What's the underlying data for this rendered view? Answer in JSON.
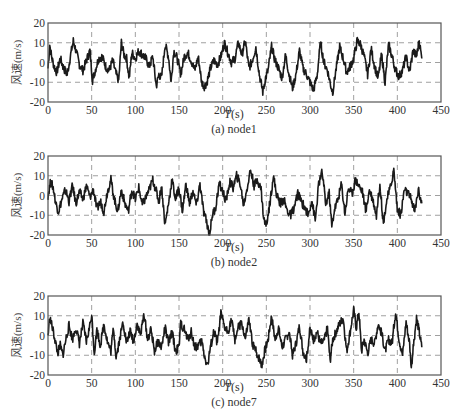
{
  "chart_data": [
    {
      "type": "line",
      "title": "(a) node1",
      "xlabel": "T(s)",
      "ylabel": "风速(m/s)",
      "xlim": [
        0,
        450
      ],
      "ylim": [
        -20,
        20
      ],
      "xticks": [
        0,
        50,
        100,
        150,
        200,
        250,
        300,
        350,
        400,
        450
      ],
      "yticks": [
        20,
        10,
        0,
        -10,
        -20
      ],
      "grid": true,
      "series": [
        {
          "name": "node1",
          "x": [
            0,
            2,
            4,
            7,
            10,
            14,
            18,
            22,
            26,
            29,
            32,
            36,
            40,
            44,
            48,
            51,
            54,
            58,
            62,
            66,
            70,
            74,
            78,
            81,
            84,
            87,
            90,
            93,
            96,
            100,
            104,
            108,
            112,
            116,
            120,
            124,
            127,
            130,
            134,
            138,
            141,
            144,
            148,
            152,
            156,
            160,
            164,
            168,
            172,
            176,
            179,
            182,
            186,
            190,
            194,
            198,
            202,
            206,
            210,
            214,
            218,
            222,
            226,
            230,
            234,
            238,
            242,
            246,
            249,
            252,
            256,
            260,
            264,
            268,
            272,
            276,
            280,
            284,
            288,
            292,
            296,
            300,
            304,
            308,
            312,
            316,
            320,
            324,
            326,
            330,
            334,
            338,
            342,
            346,
            350,
            354,
            358,
            362,
            366,
            370,
            374,
            378,
            382,
            386,
            390,
            394,
            398,
            402,
            406,
            410,
            414,
            418,
            422,
            425,
            428
          ],
          "y": [
            -3,
            9,
            3,
            -2,
            -5,
            2,
            -3,
            -6,
            4,
            11,
            6,
            -1,
            -4,
            1,
            6,
            -9,
            -4,
            2,
            3,
            -2,
            -4,
            1,
            -6,
            -9,
            10,
            4,
            2,
            -8,
            5,
            2,
            6,
            4,
            2,
            -2,
            3,
            -12,
            -6,
            -8,
            9,
            3,
            -10,
            6,
            2,
            -6,
            3,
            5,
            1,
            -4,
            3,
            -10,
            -12,
            -10,
            -3,
            1,
            -1,
            3,
            10,
            5,
            0,
            2,
            10,
            4,
            11,
            -3,
            1,
            8,
            -6,
            -15,
            -8,
            -4,
            8,
            1,
            -3,
            -8,
            4,
            -6,
            -13,
            -6,
            6,
            -3,
            -6,
            -10,
            -14,
            -7,
            10,
            0,
            -4,
            -12,
            -15,
            -3,
            8,
            2,
            -5,
            -2,
            2,
            11,
            9,
            3,
            -6,
            7,
            -2,
            -8,
            4,
            -10,
            9,
            3,
            -4,
            -7,
            -4,
            3,
            -5,
            6,
            3,
            11,
            2
          ]
        }
      ]
    },
    {
      "type": "line",
      "title": "(b) node2",
      "xlabel": "T(s)",
      "ylabel": "风速(m/s)",
      "xlim": [
        0,
        450
      ],
      "ylim": [
        -20,
        20
      ],
      "xticks": [
        0,
        50,
        100,
        150,
        200,
        250,
        300,
        350,
        400,
        450
      ],
      "yticks": [
        20,
        10,
        0,
        -10,
        -20
      ],
      "grid": true,
      "series": [
        {
          "name": "node2",
          "x": [
            0,
            3,
            6,
            9,
            12,
            16,
            20,
            24,
            28,
            32,
            36,
            40,
            44,
            48,
            52,
            56,
            60,
            64,
            68,
            72,
            76,
            80,
            84,
            88,
            92,
            96,
            100,
            104,
            108,
            112,
            116,
            120,
            124,
            127,
            130,
            134,
            138,
            142,
            146,
            150,
            154,
            158,
            162,
            166,
            170,
            174,
            178,
            182,
            185,
            188,
            192,
            196,
            200,
            204,
            208,
            212,
            216,
            220,
            224,
            228,
            232,
            236,
            240,
            244,
            247,
            250,
            254,
            258,
            262,
            266,
            270,
            274,
            278,
            282,
            286,
            290,
            294,
            298,
            302,
            306,
            310,
            314,
            318,
            322,
            325,
            328,
            332,
            336,
            340,
            344,
            348,
            352,
            356,
            360,
            364,
            368,
            372,
            376,
            380,
            384,
            388,
            392,
            396,
            400,
            404,
            408,
            412,
            416,
            420,
            424,
            428
          ],
          "y": [
            0,
            7,
            4,
            -4,
            -8,
            -2,
            3,
            -3,
            5,
            -4,
            2,
            -2,
            5,
            -1,
            3,
            -7,
            -3,
            -8,
            2,
            8,
            -2,
            -8,
            3,
            -4,
            -8,
            3,
            -2,
            4,
            -5,
            -1,
            3,
            8,
            2,
            -3,
            5,
            -15,
            -4,
            8,
            -2,
            4,
            -8,
            6,
            -4,
            2,
            -5,
            6,
            -8,
            -14,
            -20,
            -10,
            -6,
            6,
            2,
            -3,
            7,
            4,
            10,
            6,
            -5,
            4,
            13,
            5,
            8,
            3,
            -12,
            -15,
            -4,
            10,
            0,
            -4,
            -2,
            -8,
            -10,
            -6,
            1,
            -3,
            -6,
            -10,
            -2,
            -13,
            6,
            12,
            -4,
            1,
            -16,
            -7,
            -2,
            6,
            -9,
            4,
            1,
            8,
            5,
            2,
            -8,
            3,
            -2,
            -10,
            6,
            -14,
            -2,
            4,
            13,
            -7,
            -10,
            3,
            1,
            -2,
            -8,
            3,
            -4
          ]
        }
      ]
    },
    {
      "type": "line",
      "title": "(c) node7",
      "xlabel": "T(s)",
      "ylabel": "风速(m/s)",
      "xlim": [
        0,
        450
      ],
      "ylim": [
        -20,
        20
      ],
      "xticks": [
        0,
        50,
        100,
        150,
        200,
        250,
        300,
        350,
        400,
        450
      ],
      "yticks": [
        20,
        10,
        0,
        -10,
        -20
      ],
      "grid": true,
      "series": [
        {
          "name": "node7",
          "x": [
            0,
            2,
            5,
            8,
            11,
            14,
            17,
            20,
            24,
            28,
            32,
            36,
            40,
            44,
            48,
            50,
            53,
            56,
            60,
            64,
            68,
            72,
            75,
            78,
            82,
            86,
            90,
            94,
            98,
            102,
            106,
            110,
            114,
            118,
            122,
            126,
            130,
            134,
            138,
            142,
            146,
            150,
            152,
            156,
            160,
            164,
            168,
            172,
            176,
            180,
            183,
            186,
            190,
            194,
            198,
            202,
            206,
            210,
            214,
            218,
            222,
            226,
            230,
            234,
            238,
            242,
            245,
            248,
            252,
            256,
            260,
            264,
            268,
            272,
            276,
            280,
            284,
            288,
            292,
            296,
            300,
            304,
            308,
            312,
            316,
            320,
            323,
            326,
            330,
            334,
            338,
            342,
            346,
            350,
            353,
            356,
            359,
            362,
            366,
            370,
            374,
            378,
            382,
            386,
            390,
            394,
            398,
            402,
            406,
            410,
            414,
            416,
            419,
            422,
            425,
            428
          ],
          "y": [
            0,
            9,
            4,
            -2,
            -9,
            -5,
            -10,
            -3,
            5,
            -2,
            4,
            -4,
            6,
            -3,
            5,
            11,
            -9,
            3,
            -5,
            6,
            -3,
            -8,
            4,
            -11,
            -2,
            7,
            -4,
            2,
            -3,
            6,
            0,
            11,
            -2,
            3,
            -8,
            -3,
            -6,
            4,
            -4,
            2,
            -8,
            -6,
            6,
            3,
            -2,
            2,
            -6,
            -5,
            -3,
            -12,
            -15,
            -6,
            2,
            -4,
            11,
            4,
            2,
            8,
            -2,
            4,
            6,
            -2,
            8,
            -4,
            -8,
            -12,
            -15,
            -8,
            -2,
            10,
            -2,
            4,
            -6,
            -2,
            2,
            -10,
            -4,
            5,
            -8,
            -12,
            3,
            -2,
            2,
            -4,
            -3,
            4,
            -13,
            -2,
            2,
            6,
            9,
            -8,
            2,
            13,
            4,
            12,
            -8,
            -2,
            -9,
            -2,
            -4,
            6,
            1,
            -8,
            -2,
            -4,
            12,
            -2,
            -10,
            7,
            -4,
            -16,
            -3,
            9,
            2,
            -6
          ]
        }
      ]
    }
  ],
  "panels": [
    {
      "xlabel_italic": "T",
      "xlabel_rest": "(s)",
      "caption": "(a) node1",
      "ylabel": "风速(m/s)"
    },
    {
      "xlabel_italic": "T",
      "xlabel_rest": "(s)",
      "caption": "(b) node2",
      "ylabel": "风速(m/s)"
    },
    {
      "xlabel_italic": "T",
      "xlabel_rest": "(s)",
      "caption": "(c) node7",
      "ylabel": "风速(m/s)"
    }
  ],
  "style": {
    "line_color": "#1a1a1a",
    "grid_color": "#888888",
    "axis_color": "#555555"
  }
}
